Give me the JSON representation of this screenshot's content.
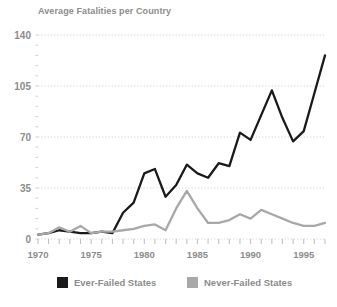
{
  "chart_data": {
    "type": "line",
    "title": "Average Fatalities per Country",
    "xlabel": "",
    "ylabel": "",
    "xlim": [
      1970,
      1997
    ],
    "ylim": [
      0,
      140
    ],
    "yticks": [
      0,
      35,
      70,
      105,
      140
    ],
    "xticks": [
      1970,
      1975,
      1980,
      1985,
      1990,
      1995
    ],
    "grid": true,
    "legend_position": "bottom",
    "x": [
      1970,
      1971,
      1972,
      1973,
      1974,
      1975,
      1976,
      1977,
      1978,
      1979,
      1980,
      1981,
      1982,
      1983,
      1984,
      1985,
      1986,
      1987,
      1988,
      1989,
      1990,
      1991,
      1992,
      1993,
      1994,
      1995,
      1996,
      1997
    ],
    "series": [
      {
        "name": "Ever-Failed States",
        "color": "#1a1a1a",
        "values": [
          3,
          4,
          6,
          5,
          4,
          4,
          5,
          4,
          18,
          25,
          45,
          48,
          29,
          37,
          51,
          45,
          42,
          52,
          50,
          73,
          68,
          85,
          102,
          83,
          67,
          74,
          100,
          126
        ]
      },
      {
        "name": "Never-Failed States",
        "color": "#a8a8a8",
        "values": [
          3,
          4,
          8,
          5,
          9,
          4,
          5,
          5,
          6,
          7,
          9,
          10,
          6,
          21,
          33,
          21,
          11,
          11,
          13,
          17,
          14,
          20,
          17,
          14,
          11,
          9,
          9,
          11
        ]
      }
    ],
    "colors": {
      "axis_text": "#8c8c8c",
      "grid": "#cfcfcf",
      "background": "#ffffff",
      "ever_failed": "#1a1a1a",
      "never_failed": "#a8a8a8"
    },
    "legend": [
      {
        "label": "Ever-Failed States",
        "color": "#1a1a1a"
      },
      {
        "label": "Never-Failed States",
        "color": "#a8a8a8"
      }
    ]
  }
}
